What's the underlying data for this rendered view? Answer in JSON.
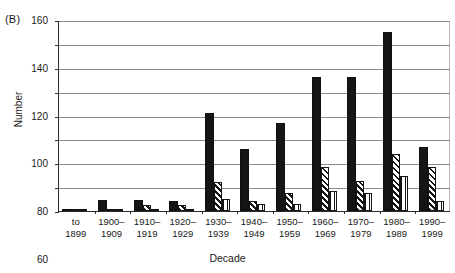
{
  "figure": {
    "panel_label": "(B)",
    "x_axis_title": "Decade",
    "y_axis_title": "Number"
  },
  "chart_data": {
    "type": "bar",
    "title": "",
    "subtitle": "",
    "panel": "(B)",
    "xlabel": "Decade",
    "ylabel": "Number",
    "ylim": [
      0,
      160
    ],
    "yticks": [
      0,
      20,
      40,
      60,
      80,
      100,
      120,
      140,
      160
    ],
    "grid": true,
    "legend": "none",
    "orientation": "vertical",
    "grouping": "clustered",
    "categories": [
      "to\n1899",
      "1900–\n1909",
      "1910–\n1919",
      "1920–\n1929",
      "1930–\n1939",
      "1940–\n1949",
      "1950–\n1959",
      "1960–\n1969",
      "1970–\n1979",
      "1980–\n1989",
      "1990–\n1999"
    ],
    "series": [
      {
        "name": "series-1",
        "fill": "solid-black",
        "color": "#151515",
        "values": [
          2,
          9,
          9,
          8,
          82,
          52,
          74,
          112,
          112,
          150,
          54
        ]
      },
      {
        "name": "series-2",
        "fill": "diagonal-hatch",
        "color": "#151515",
        "values": [
          1,
          1,
          5,
          5,
          24,
          8,
          15,
          37,
          25,
          48,
          37
        ]
      },
      {
        "name": "series-3",
        "fill": "vertical-stripes",
        "color": "#151515",
        "values": [
          1,
          1,
          1,
          2,
          10,
          6,
          6,
          17,
          15,
          29,
          8
        ]
      }
    ]
  }
}
